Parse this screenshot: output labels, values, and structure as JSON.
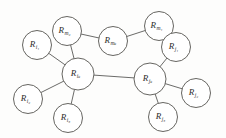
{
  "diagram": {
    "type": "node-link-graph",
    "title": "",
    "background_color": "#fdfdfc",
    "node_fill": "#ffffff",
    "node_stroke": "#55544f",
    "edge_color": "#5a5a58",
    "nodes": [
      {
        "id": "m2",
        "base": "R",
        "sub": "m₂",
        "sub_text": "m2",
        "cx": 67,
        "cy": 31,
        "r": 14.5
      },
      {
        "id": "mk",
        "base": "R",
        "sub": "mₖ",
        "sub_text": "mk",
        "cx": 113,
        "cy": 41,
        "r": 14.5
      },
      {
        "id": "m1",
        "base": "R",
        "sub": "m₁",
        "sub_text": "m1",
        "cx": 159,
        "cy": 26,
        "r": 14.5
      },
      {
        "id": "i1",
        "base": "R",
        "sub": "i₁",
        "sub_text": "i1",
        "cx": 37,
        "cy": 45,
        "r": 14.5
      },
      {
        "id": "j1",
        "base": "R",
        "sub": "j₁",
        "sub_text": "j1",
        "cx": 176,
        "cy": 47,
        "r": 14.5
      },
      {
        "id": "ik",
        "base": "R",
        "sub": "iₖ",
        "sub_text": "ik",
        "cx": 78,
        "cy": 74,
        "r": 16.0
      },
      {
        "id": "jk",
        "base": "R",
        "sub": "jₖ",
        "sub_text": "jk",
        "cx": 150,
        "cy": 79,
        "r": 16.0
      },
      {
        "id": "i2",
        "base": "R",
        "sub": "i₂",
        "sub_text": "i2",
        "cx": 28,
        "cy": 99,
        "r": 14.5
      },
      {
        "id": "j2",
        "base": "R",
        "sub": "j₂",
        "sub_text": "j2",
        "cx": 196,
        "cy": 93,
        "r": 14.5
      },
      {
        "id": "i3",
        "base": "R",
        "sub": "i₃",
        "sub_text": "i3",
        "cx": 68,
        "cy": 118,
        "r": 14.5
      },
      {
        "id": "j3",
        "base": "R",
        "sub": "j₃",
        "sub_text": "j3",
        "cx": 163,
        "cy": 117,
        "r": 14.5
      }
    ],
    "edges": [
      {
        "from": "m2",
        "to": "mk"
      },
      {
        "from": "mk",
        "to": "m1"
      },
      {
        "from": "m2",
        "to": "ik"
      },
      {
        "from": "m1",
        "to": "j1"
      },
      {
        "from": "i1",
        "to": "ik"
      },
      {
        "from": "ik",
        "to": "jk"
      },
      {
        "from": "ik",
        "to": "i2"
      },
      {
        "from": "ik",
        "to": "i3"
      },
      {
        "from": "j1",
        "to": "jk"
      },
      {
        "from": "jk",
        "to": "j2"
      },
      {
        "from": "jk",
        "to": "j3"
      }
    ]
  }
}
